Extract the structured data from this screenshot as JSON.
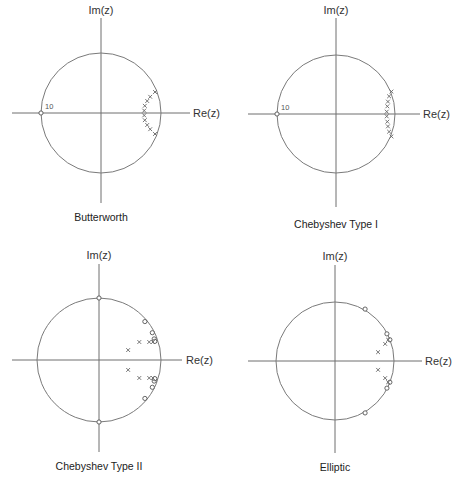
{
  "figure": {
    "axis_labels": {
      "real": "Re(z)",
      "imag": "Im(z)"
    }
  },
  "chart_data": [
    {
      "type": "scatter",
      "title": "Butterworth",
      "xlabel": "Re(z)",
      "ylabel": "Im(z)",
      "unit_circle": true,
      "annotations": [
        {
          "text": "10",
          "at": [
            -1,
            0
          ]
        }
      ],
      "zeros": [
        [
          -1.0,
          0.0
        ]
      ],
      "zero_multiplicity": 10,
      "poles": [
        [
          0.9,
          0.35
        ],
        [
          0.82,
          0.27
        ],
        [
          0.77,
          0.2
        ],
        [
          0.73,
          0.12
        ],
        [
          0.72,
          0.04
        ],
        [
          0.72,
          -0.04
        ],
        [
          0.73,
          -0.12
        ],
        [
          0.77,
          -0.2
        ],
        [
          0.82,
          -0.27
        ],
        [
          0.9,
          -0.35
        ]
      ]
    },
    {
      "type": "scatter",
      "title": "Chebyshev Type I",
      "xlabel": "Re(z)",
      "ylabel": "Im(z)",
      "unit_circle": true,
      "annotations": [
        {
          "text": "10",
          "at": [
            -1,
            0
          ]
        }
      ],
      "zeros": [
        [
          -1.0,
          0.0
        ]
      ],
      "zero_multiplicity": 10,
      "poles": [
        [
          0.94,
          0.38
        ],
        [
          0.9,
          0.3
        ],
        [
          0.88,
          0.21
        ],
        [
          0.87,
          0.13
        ],
        [
          0.86,
          0.04
        ],
        [
          0.86,
          -0.04
        ],
        [
          0.87,
          -0.13
        ],
        [
          0.88,
          -0.21
        ],
        [
          0.9,
          -0.3
        ],
        [
          0.94,
          -0.38
        ]
      ]
    },
    {
      "type": "scatter",
      "title": "Chebyshev Type II",
      "xlabel": "Re(z)",
      "ylabel": "Im(z)",
      "unit_circle": true,
      "zeros": [
        [
          0.0,
          1.0
        ],
        [
          0.0,
          -1.0
        ],
        [
          0.74,
          0.62
        ],
        [
          0.74,
          -0.62
        ],
        [
          0.86,
          0.44
        ],
        [
          0.86,
          -0.44
        ],
        [
          0.89,
          0.34
        ],
        [
          0.89,
          -0.34
        ],
        [
          0.9,
          0.3
        ],
        [
          0.9,
          -0.3
        ]
      ],
      "poles": [
        [
          0.47,
          0.16
        ],
        [
          0.47,
          -0.16
        ],
        [
          0.65,
          0.29
        ],
        [
          0.65,
          -0.29
        ],
        [
          0.81,
          0.29
        ],
        [
          0.81,
          -0.29
        ],
        [
          0.87,
          0.29
        ],
        [
          0.87,
          -0.29
        ]
      ]
    },
    {
      "type": "scatter",
      "title": "Elliptic",
      "xlabel": "Re(z)",
      "ylabel": "Im(z)",
      "unit_circle": true,
      "zeros": [
        [
          0.51,
          0.88
        ],
        [
          0.51,
          -0.88
        ],
        [
          0.88,
          0.46
        ],
        [
          0.88,
          -0.46
        ],
        [
          0.93,
          0.36
        ],
        [
          0.93,
          -0.36
        ]
      ],
      "poles": [
        [
          0.73,
          0.15
        ],
        [
          0.73,
          -0.15
        ],
        [
          0.85,
          0.29
        ],
        [
          0.85,
          -0.29
        ],
        [
          0.9,
          0.36
        ],
        [
          0.9,
          -0.36
        ]
      ]
    }
  ],
  "layout": {
    "panels": [
      {
        "cx": 101,
        "cy": 113,
        "r": 60,
        "ax_left": 12,
        "ax_right": 190,
        "ax_top": 18,
        "ax_bottom": 203,
        "title_y": 221,
        "re_x": 193,
        "im_y": 14,
        "ann_dx": 4,
        "ann_dy": -4
      },
      {
        "cx": 336,
        "cy": 114,
        "r": 59,
        "ax_left": 248,
        "ax_right": 420,
        "ax_top": 18,
        "ax_bottom": 207,
        "title_y": 228,
        "re_x": 423,
        "im_y": 14,
        "ann_dx": 4,
        "ann_dy": -4
      },
      {
        "cx": 99,
        "cy": 360,
        "r": 62,
        "ax_left": 12,
        "ax_right": 182,
        "ax_top": 264,
        "ax_bottom": 452,
        "title_y": 470,
        "re_x": 186,
        "im_y": 259,
        "ann_dx": 4,
        "ann_dy": -4
      },
      {
        "cx": 335,
        "cy": 361,
        "r": 59,
        "ax_left": 248,
        "ax_right": 422,
        "ax_top": 265,
        "ax_bottom": 453,
        "title_y": 471,
        "re_x": 425,
        "im_y": 260,
        "ann_dx": 4,
        "ann_dy": -4
      }
    ],
    "colors": {
      "axis": "#6e6e6e",
      "circle": "#7a7a7a",
      "marker": "#555555",
      "background": "#ffffff"
    }
  }
}
